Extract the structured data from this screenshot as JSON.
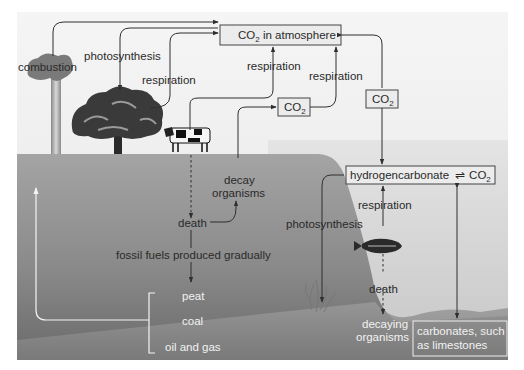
{
  "diagram": {
    "title_cutoff": "",
    "nodes": {
      "atmosphere": {
        "prefix": "CO",
        "sub": "2",
        "suffix": " in atmosphere"
      },
      "co2_mid": {
        "prefix": "CO",
        "sub": "2"
      },
      "co2_right": {
        "prefix": "CO",
        "sub": "2"
      },
      "hydrogencarbonate": {
        "text": "hydrogencarbonate",
        "eq": "⇌",
        "prefix": "CO",
        "sub": "2"
      },
      "carbonates": {
        "line1": "carbonates, such",
        "line2": "as limestones"
      }
    },
    "labels": {
      "combustion": "combustion",
      "photosynthesis_land": "photosynthesis",
      "respiration_tree": "respiration",
      "respiration_cow": "respiration",
      "respiration_decay": "respiration",
      "decay_organisms_1": "decay",
      "decay_organisms_2": "organisms",
      "death_land": "death",
      "fossil_fuels": "fossil fuels produced gradually",
      "peat": "peat",
      "coal": "coal",
      "oil_gas": "oil and gas",
      "photosynthesis_sea": "photosynthesis",
      "respiration_sea": "respiration",
      "death_sea": "death",
      "decaying_1": "decaying",
      "decaying_2": "organisms"
    },
    "icons": [
      "smokestack-icon",
      "tree-icon",
      "cow-icon",
      "fish-icon",
      "seaweed-icon"
    ],
    "colors": {
      "sky": "#efefef",
      "ground_top": "#9a9a9a",
      "ground_bottom": "#6e6e6e",
      "water": "#d4d4d4",
      "seabed": "#8c8c8c",
      "line": "#2f2f2f"
    }
  }
}
